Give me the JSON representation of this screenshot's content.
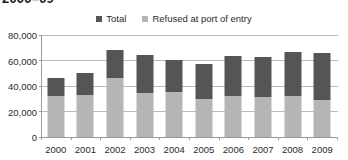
{
  "chart_data": {
    "type": "bar",
    "title": "2000–09",
    "subtitle": "",
    "xlabel": "",
    "ylabel": "",
    "stacked": true,
    "grid": true,
    "legend_position": "top-center",
    "categories": [
      "2000",
      "2001",
      "2002",
      "2003",
      "2004",
      "2005",
      "2006",
      "2007",
      "2008",
      "2009"
    ],
    "ylim": [
      0,
      80000
    ],
    "yticks": [
      0,
      20000,
      40000,
      60000,
      80000
    ],
    "ytick_labels": [
      "0",
      "20,000",
      "40,000",
      "60,000",
      "80,000"
    ],
    "series": [
      {
        "name": "Refused at port of entry",
        "color": "#b5b5b5",
        "values": [
          32000,
          33000,
          46000,
          34500,
          35500,
          30000,
          32000,
          31000,
          32500,
          29000
        ]
      },
      {
        "name": "Total",
        "color": "#555555",
        "values": [
          46500,
          50000,
          68000,
          64000,
          60500,
          57500,
          63500,
          62500,
          67000,
          66000
        ]
      }
    ],
    "legend": [
      {
        "label": "Total",
        "color": "#555555",
        "swatch": "square-marker"
      },
      {
        "label": "Refused at port of entry",
        "color": "#b5b5b5",
        "swatch": "square-marker"
      }
    ]
  }
}
